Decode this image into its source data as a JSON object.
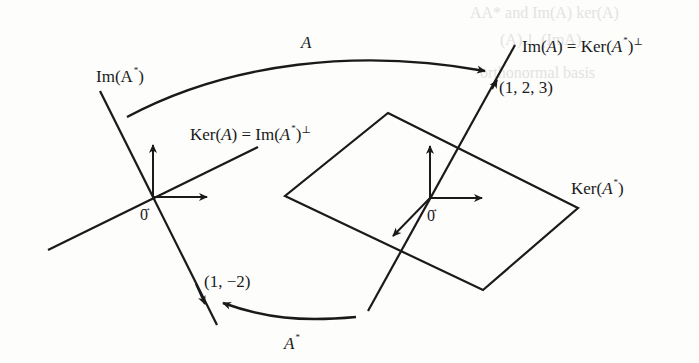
{
  "diagram": {
    "type": "linear-map-subspaces",
    "maps": {
      "A": {
        "label": "A",
        "from": "Im(A*)",
        "to": "Im(A)"
      },
      "A_star": {
        "label": "A",
        "star": "*",
        "from": "Im(A)",
        "to": "Im(A*)"
      }
    },
    "left_space": {
      "line_label_main": "Im(A",
      "line_label_star": "*",
      "line_label_close": ")",
      "plane_label_prefix": "Ker(",
      "plane_label_A": "A",
      "plane_label_mid": ") = Im(",
      "plane_label_A2": "A",
      "plane_label_star": "*",
      "plane_label_close": ")",
      "plane_label_perp": "⊥",
      "origin_label": "0",
      "origin_arrow": "→",
      "point_label": "(1, −2)"
    },
    "right_space": {
      "line_label_prefix": "Im(",
      "line_label_A": "A",
      "line_label_mid": ") = Ker(",
      "line_label_A2": "A",
      "line_label_star": "*",
      "line_label_close": ")",
      "line_label_perp": "⊥",
      "plane_label_prefix": "Ker(",
      "plane_label_A": "A",
      "plane_label_star": "*",
      "plane_label_close": ")",
      "origin_label": "0",
      "origin_arrow": "→",
      "point_label": "(1, 2, 3)"
    },
    "colors": {
      "ink": "#1a1a1a",
      "paper": "#fdfdfc",
      "bleed": "#d8d8d6"
    }
  }
}
